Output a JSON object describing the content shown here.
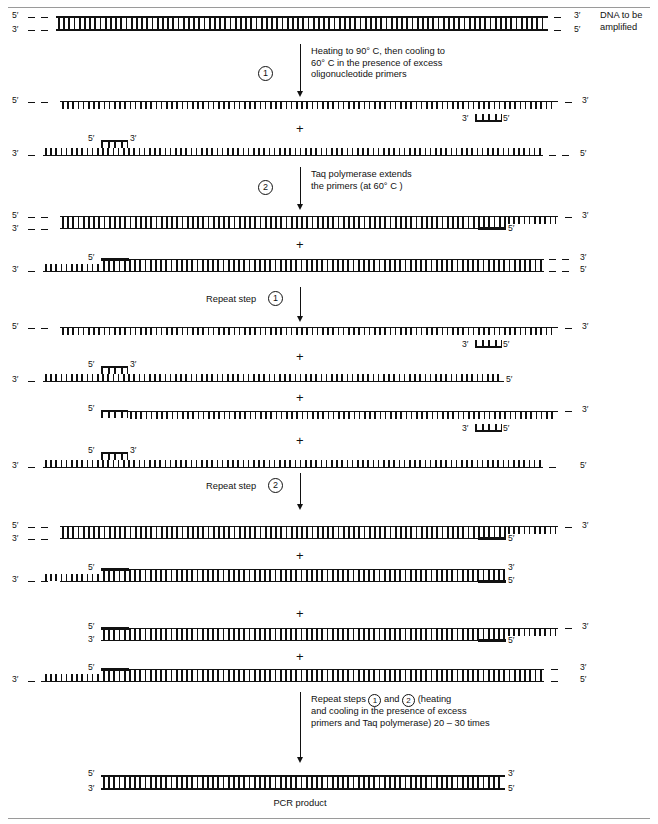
{
  "figure": {
    "title_caption_right": "DNA to be\namplified",
    "product_label": "PCR product"
  },
  "steps": [
    {
      "id": "step-1",
      "number": "1",
      "text": "Heating to 90° C, then cooling to\n60° C in the presence of excess\noligonucleotide primers"
    },
    {
      "id": "step-2",
      "number": "2",
      "text": "Taq polymerase extends\nthe primers (at 60° C )"
    },
    {
      "id": "repeat-step-1",
      "number": "1",
      "prefix": "Repeat step",
      "text": "Repeat step"
    },
    {
      "id": "repeat-step-2",
      "number": "2",
      "prefix": "Repeat step",
      "text": "Repeat step"
    },
    {
      "id": "repeat-steps-1-and-2",
      "text_part1": "Repeat steps",
      "text_part2": "and",
      "text_part3": "(heating",
      "text_rest": "and cooling in the presence of excess\nprimers and Taq polymerase) 20 – 30 times",
      "number_a": "1",
      "number_b": "2"
    }
  ],
  "labels": {
    "five_prime": "5′",
    "three_prime": "3′",
    "plus": "+"
  },
  "colors": {
    "ink": "#111111",
    "rule": "#9a9a9a",
    "background": "#ffffff"
  },
  "strand_groups": [
    {
      "name": "original-duplex",
      "description": "DNA to be amplified, double stranded"
    },
    {
      "name": "denatured-with-primers",
      "description": "Two separated strands each annealed to a primer"
    },
    {
      "name": "extended-duplexes-round1",
      "description": "Two partly double stranded products after Taq extension"
    },
    {
      "name": "denatured-round2",
      "description": "Four single strands each with annealed primer"
    },
    {
      "name": "extended-duplexes-round2",
      "description": "Four duplex products after second extension"
    },
    {
      "name": "pcr-product",
      "description": "Short fully double stranded PCR product"
    }
  ]
}
